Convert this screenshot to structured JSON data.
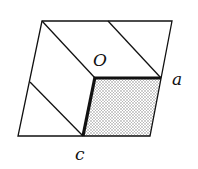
{
  "diagram": {
    "type": "crystal-lattice-cell",
    "labels": {
      "origin": "O",
      "a_vertex": "a",
      "c_vertex": "c"
    },
    "colors": {
      "stroke": "#111111",
      "shade": "#c8c8c8",
      "background": "#ffffff"
    },
    "vertices": {
      "outer_top_left": [
        42,
        21
      ],
      "outer_top_right": [
        172,
        21
      ],
      "outer_bottom_right": [
        150,
        136
      ],
      "outer_bottom_left": [
        18,
        136
      ],
      "O": [
        95,
        78
      ],
      "a": [
        161,
        78
      ],
      "c": [
        83,
        136
      ],
      "shade_bottom_right": [
        150,
        136
      ]
    }
  }
}
